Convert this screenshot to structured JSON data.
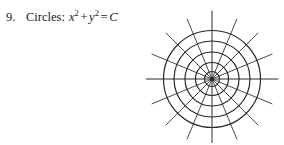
{
  "problem": {
    "number": "9.",
    "label": "Circles:",
    "equation_text": "x² + y² = C",
    "variable_x": "x",
    "variable_y": "y",
    "exponent": "2",
    "plus_sign": "+",
    "equals_sign": "=",
    "constant": "C",
    "text_color": "#1a1a1a"
  },
  "figure": {
    "name": "polar-grid-of-concentric-circles",
    "caption_alt": "Family of concentric circles with radial trajectory lines",
    "stroke_color": "#2b2b2b",
    "background_color": "#ffffff",
    "center": {
      "x": 66,
      "y": 76
    },
    "circle_radii": [
      7.5,
      16.5,
      27,
      38,
      48.5
    ],
    "circle_count": 5,
    "spoke_count": 16,
    "spoke_angle_step_degrees": 22.5,
    "spoke_inner_radius": 0,
    "spoke_outer_radius": 65,
    "axis_line_length": 66,
    "circle_stroke_width": 1.2,
    "spoke_stroke_width": 0.85,
    "axis_stroke_width": 1.0,
    "center_dot_radius": 2.2
  }
}
